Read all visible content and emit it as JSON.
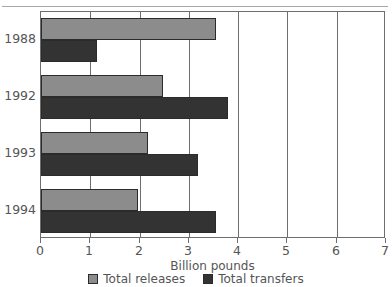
{
  "chart_data": {
    "type": "bar",
    "orientation": "horizontal",
    "title": "",
    "xlabel": "Billion pounds",
    "ylabel": "",
    "categories": [
      "1988",
      "1992",
      "1993",
      "1994"
    ],
    "series": [
      {
        "name": "Total releases",
        "color": "#8c8c8c",
        "values": [
          3.55,
          2.47,
          2.17,
          1.97
        ]
      },
      {
        "name": "Total transfers",
        "color": "#333333",
        "values": [
          1.14,
          3.79,
          3.18,
          3.55
        ]
      }
    ],
    "xlim": [
      0,
      7
    ],
    "xticks": [
      0,
      1,
      2,
      3,
      4,
      5,
      6,
      7
    ],
    "xticklabels": [
      "0",
      "1",
      "2",
      "3",
      "4",
      "5",
      "6",
      "7"
    ],
    "grid": true,
    "grid_axis": "x",
    "legend_position": "bottom",
    "legend": [
      "Total releases",
      "Total transfers"
    ]
  },
  "style": {
    "bar_releases_color": "#8c8c8c",
    "bar_transfers_color": "#333333",
    "frame_color": "#6e6e6e",
    "text_color": "#555555",
    "background": "#ffffff"
  }
}
